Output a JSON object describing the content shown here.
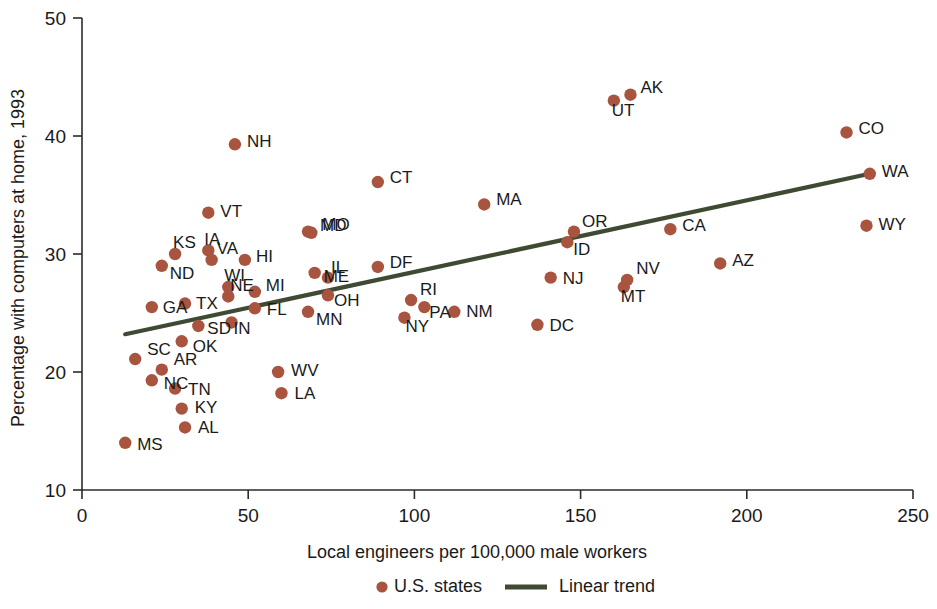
{
  "chart_data": {
    "type": "scatter",
    "title": "",
    "xlabel": "Local engineers per 100,000 male workers",
    "ylabel": "Percentage with computers at home, 1993",
    "xlim": [
      0,
      250
    ],
    "ylim": [
      10,
      50
    ],
    "xticks": [
      0,
      50,
      100,
      150,
      200,
      250
    ],
    "yticks": [
      10,
      20,
      30,
      40,
      50
    ],
    "xtick_labels": [
      "0",
      "50",
      "100",
      "150",
      "200",
      "250"
    ],
    "ytick_labels": [
      "10",
      "20",
      "30",
      "40",
      "50"
    ],
    "grid": false,
    "legend_position": "bottom",
    "series": [
      {
        "name": "U.S. states",
        "type": "scatter",
        "marker": "circle",
        "color": "#a8543f",
        "point_labels": [
          "MS",
          "SC",
          "NC",
          "AR",
          "TN",
          "KY",
          "AL",
          "OK",
          "GA",
          "ND",
          "KS",
          "TX",
          "SD",
          "VT",
          "IA",
          "VA",
          "NE",
          "IN",
          "WI",
          "MI",
          "NH",
          "HI",
          "FL",
          "WV",
          "LA",
          "MO",
          "ME",
          "MN",
          "OH",
          "IL",
          "MD",
          "DF",
          "CT",
          "NY",
          "RI",
          "PA",
          "NM",
          "MA",
          "DC",
          "NJ",
          "ID",
          "OR",
          "UT",
          "AK",
          "CA",
          "MT",
          "NV",
          "AZ",
          "CO",
          "WY",
          "WA"
        ],
        "x": [
          13,
          16,
          21,
          24,
          28,
          30,
          31,
          30,
          21,
          24,
          28,
          31,
          35,
          38,
          38,
          39,
          44,
          45,
          44,
          52,
          46,
          49,
          52,
          59,
          60,
          69,
          70,
          68,
          74,
          74,
          68,
          89,
          89,
          97,
          99,
          103,
          112,
          121,
          137,
          141,
          146,
          148,
          160,
          165,
          177,
          163,
          164,
          192,
          230,
          236,
          237
        ],
        "y": [
          14.0,
          21.1,
          19.3,
          20.2,
          18.6,
          16.9,
          15.3,
          22.6,
          25.5,
          29.0,
          30.0,
          25.8,
          23.9,
          33.5,
          30.3,
          29.5,
          26.4,
          24.2,
          27.2,
          26.8,
          39.3,
          29.5,
          25.4,
          20.0,
          18.2,
          31.8,
          28.4,
          25.1,
          26.5,
          28.0,
          31.9,
          28.9,
          36.1,
          24.6,
          26.1,
          25.5,
          25.1,
          34.2,
          24.0,
          28.0,
          31.0,
          31.9,
          43.0,
          43.5,
          32.1,
          27.2,
          27.8,
          29.2,
          40.3,
          32.4,
          36.8
        ]
      },
      {
        "name": "Linear trend",
        "type": "line",
        "color": "#3f4a33",
        "x": [
          13,
          237
        ],
        "y": [
          23.2,
          36.8
        ]
      }
    ]
  },
  "legend": {
    "items": [
      {
        "label": "U.S. states",
        "marker": "dot",
        "color": "#a8543f"
      },
      {
        "label": "Linear trend",
        "marker": "line",
        "color": "#3f4a33"
      }
    ]
  },
  "colors": {
    "point": "#a8543f",
    "trend": "#3f4a33",
    "axis": "#2b2b2b",
    "text": "#1a1a1a",
    "background": "#ffffff"
  }
}
